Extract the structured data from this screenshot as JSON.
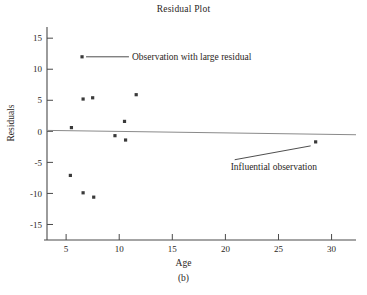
{
  "figure": {
    "title": "Residual Plot",
    "caption": "(b)"
  },
  "chart_data": {
    "type": "scatter",
    "title": "Residual Plot",
    "xlabel": "Age",
    "ylabel": "Residuals",
    "xlim": [
      3.2,
      32.3
    ],
    "ylim": [
      -17.5,
      16.8
    ],
    "xticks": [
      5,
      10,
      15,
      20,
      25,
      30
    ],
    "xtick_labels": [
      "5",
      "10",
      "15",
      "20",
      "25",
      "30"
    ],
    "yticks": [
      15,
      10,
      5,
      0,
      -5,
      -10,
      -15
    ],
    "ytick_labels": [
      "15",
      "10",
      "5",
      "0",
      "-5",
      "-10",
      "-15"
    ],
    "grid": false,
    "legend": null,
    "series": [
      {
        "name": "residuals",
        "marker": "square",
        "color": "#3a3a3a",
        "x": [
          6.5,
          5.5,
          6.6,
          7.5,
          5.4,
          6.6,
          7.6,
          9.6,
          10.5,
          10.6,
          11.6,
          28.5
        ],
        "y": [
          12.0,
          0.6,
          5.2,
          5.4,
          -7.1,
          -9.9,
          -10.6,
          -0.7,
          1.6,
          -1.4,
          5.9,
          -1.7
        ]
      }
    ],
    "reference_line": {
      "name": "zero-residual-line",
      "color": "#8a8a8a",
      "x": [
        3.2,
        32.3
      ],
      "y": [
        0.15,
        -0.55
      ]
    },
    "annotations": [
      {
        "text": "Observation with large residual",
        "points_to": [
          6.5,
          12.0
        ],
        "text_x": 11.2,
        "text_y": 12.0,
        "leader": "horizontal"
      },
      {
        "text": "Influential observation",
        "points_to": [
          28.5,
          -1.7
        ],
        "text_x": 20.5,
        "text_y": -5.7,
        "leader": "diagonal"
      }
    ]
  }
}
